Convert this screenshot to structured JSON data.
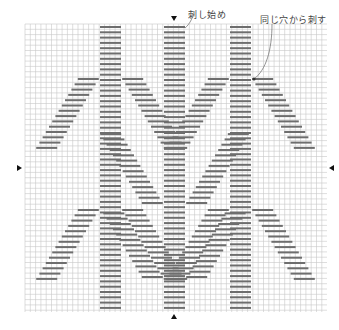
{
  "diagram": {
    "faint_header": "",
    "labels": {
      "start": "刺し始め",
      "same_hole": "同じ穴から刺す"
    },
    "colors": {
      "grid_line": "#c8c8c8",
      "stitch": "#6e6e6e",
      "text": "#444444",
      "marker": "#111111"
    },
    "grid": {
      "left": 25,
      "top": 24,
      "right": 327,
      "bottom": 312,
      "cell": 5.3
    },
    "stitch": {
      "row_pitch": 5.3,
      "width": 21,
      "thickness": 2,
      "first_row_y": 27,
      "last_row_y": 308
    },
    "columns": [
      {
        "name": "left-column",
        "x": 100
      },
      {
        "name": "center-column",
        "x": 164
      },
      {
        "name": "right-column",
        "x": 230
      }
    ],
    "branches": [
      {
        "column": 0,
        "apex_y": 79,
        "direction": "outward-down",
        "length": 14
      },
      {
        "column": 0,
        "apex_y": 210,
        "direction": "outward-down",
        "length": 14
      },
      {
        "column": 2,
        "apex_y": 79,
        "direction": "outward-down",
        "length": 14
      },
      {
        "column": 2,
        "apex_y": 210,
        "direction": "outward-down",
        "length": 14
      },
      {
        "column": 1,
        "apex_y": 203,
        "direction": "inward-up",
        "length": 14
      },
      {
        "column": 1,
        "apex_y": 277,
        "direction": "inward-up",
        "length": 13
      }
    ],
    "center_markers": {
      "top": {
        "x": 174,
        "y": 19
      },
      "bottom": {
        "x": 174,
        "y": 313
      },
      "left": {
        "x": 17,
        "y": 168
      },
      "right": {
        "x": 329,
        "y": 168
      }
    },
    "annotations": {
      "start_label_pos": {
        "x": 188,
        "y": 8
      },
      "same_hole_label_pos": {
        "x": 260,
        "y": 13
      },
      "start_leader": "M185,28 C190,24 192,18 194,14",
      "same_hole_leader": "M272,24 C272,50 266,70 254,79",
      "same_hole_dot": {
        "x": 254,
        "y": 79
      }
    }
  }
}
